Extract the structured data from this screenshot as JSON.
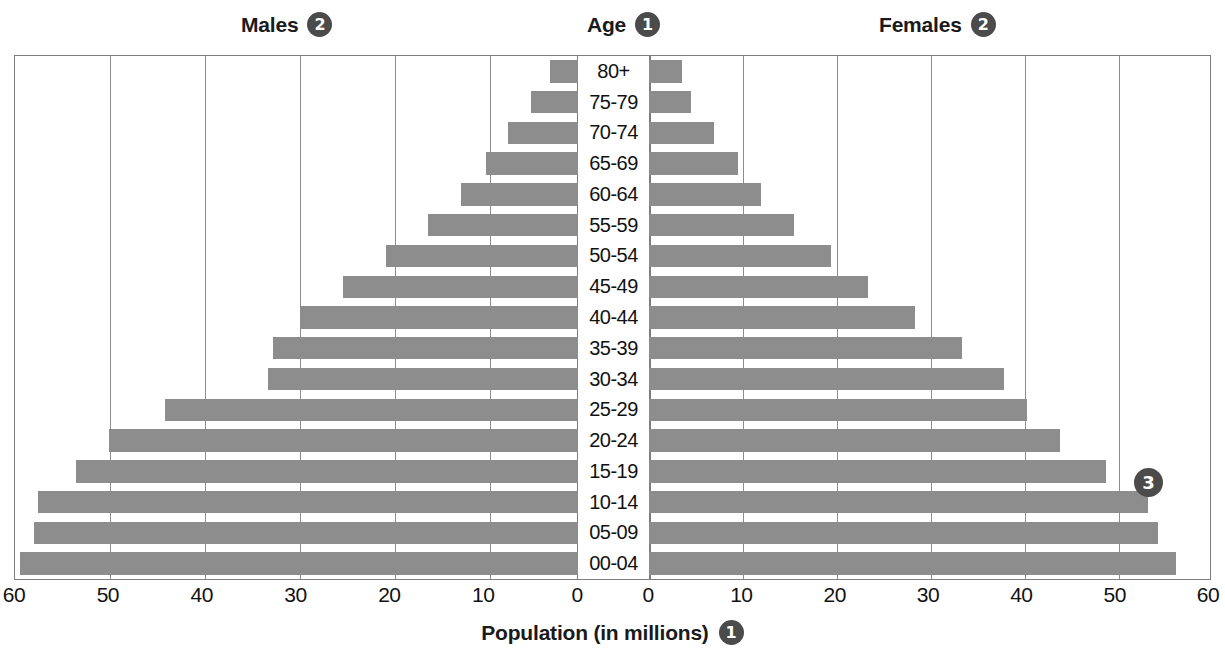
{
  "headers": {
    "males": {
      "label": "Males",
      "badge": "2"
    },
    "age": {
      "label": "Age",
      "badge": "1"
    },
    "females": {
      "label": "Females",
      "badge": "2"
    }
  },
  "callout": {
    "badge": "3"
  },
  "footer": {
    "label": "Population (in millions)",
    "badge": "1"
  },
  "axis": {
    "left_ticks": [
      "60",
      "50",
      "40",
      "30",
      "20",
      "10",
      "0"
    ],
    "right_ticks": [
      "0",
      "10",
      "20",
      "30",
      "40",
      "50",
      "60"
    ]
  },
  "colors": {
    "bar": "#8d8d8d",
    "badge": "#4b4b4b",
    "grid": "#8c8c8c",
    "frame": "#7d7d7d",
    "text": "#111111"
  },
  "chart_data": {
    "type": "bar",
    "subtype": "population-pyramid",
    "title": "Population (in millions)",
    "xlabel": "Population (in millions)",
    "ylabel": "Age",
    "xlim": [
      0,
      60
    ],
    "grid": true,
    "grid_step": 10,
    "legend": [
      "Males",
      "Females"
    ],
    "legend_position": "top",
    "categories": [
      "80+",
      "75-79",
      "70-74",
      "65-69",
      "60-64",
      "55-59",
      "50-54",
      "45-49",
      "40-44",
      "35-39",
      "30-34",
      "25-29",
      "20-24",
      "15-19",
      "10-14",
      "05-09",
      "00-04"
    ],
    "series": [
      {
        "name": "Males",
        "direction": "left",
        "values": [
          3.0,
          5.0,
          7.5,
          9.8,
          12.5,
          16.0,
          20.5,
          25.0,
          29.5,
          32.5,
          33.0,
          44.0,
          50.0,
          53.5,
          57.5,
          58.0,
          59.5
        ]
      },
      {
        "name": "Females",
        "direction": "right",
        "values": [
          3.5,
          4.5,
          7.0,
          9.5,
          12.0,
          15.5,
          19.5,
          23.5,
          28.5,
          33.5,
          38.0,
          40.5,
          44.0,
          49.0,
          53.5,
          54.5,
          56.5
        ]
      }
    ]
  }
}
